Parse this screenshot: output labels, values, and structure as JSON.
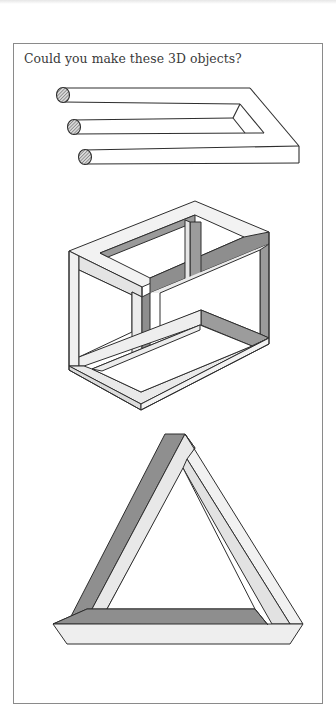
{
  "page": {
    "title": "Could you make these 3D objects?"
  },
  "figures": [
    {
      "id": "impossible-trident",
      "label": "three-pronged impossible fork"
    },
    {
      "id": "impossible-cube",
      "label": "impossible box frame"
    },
    {
      "id": "penrose-triangle",
      "label": "impossible triangle"
    }
  ],
  "colors": {
    "background": "#ffffff",
    "frame_border": "#8a8a8a",
    "line": "#2e2e2e",
    "shade_dark": "#8c8c8c",
    "shade_mid": "#bdbdbd",
    "shade_light": "#ececec",
    "title_text": "#3a3a3a"
  }
}
